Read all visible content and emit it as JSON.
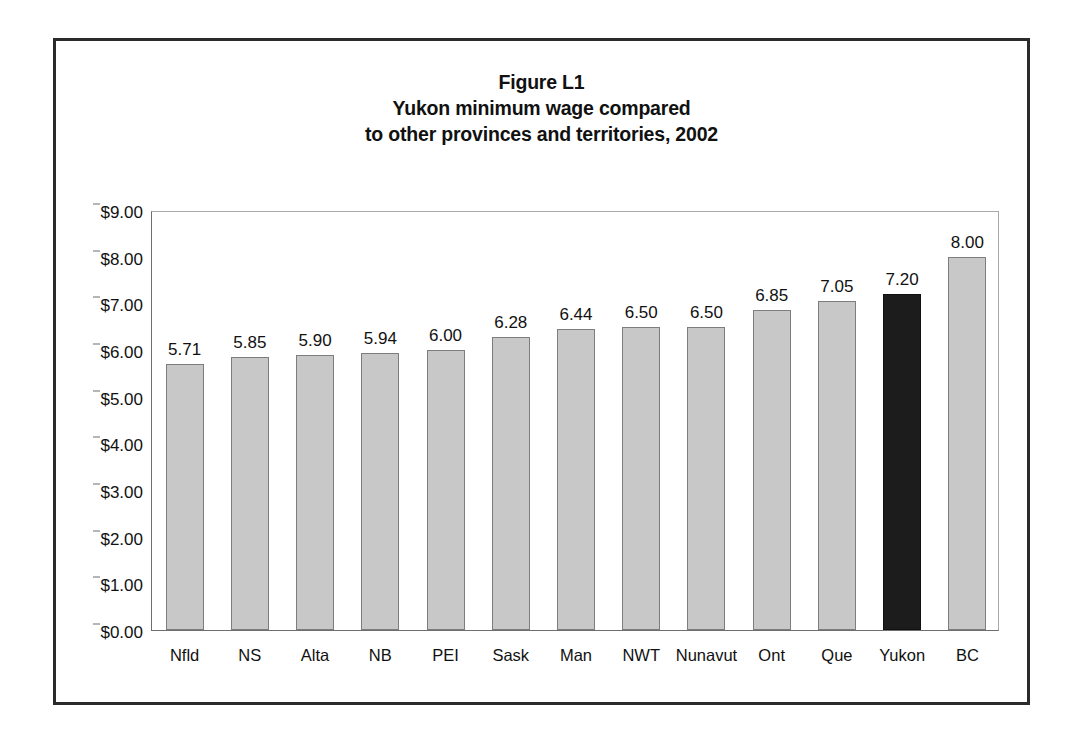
{
  "figure": {
    "title_lines": [
      "Figure L1",
      "Yukon minimum wage compared",
      "to other provinces and territories, 2002"
    ]
  },
  "colors": {
    "bar_fill": "#c8c8c8",
    "bar_border": "#7d7d7d",
    "highlight_fill": "#1c1c1c",
    "frame": "#2b2b2b",
    "axis": "#6e6e6e"
  },
  "chart_data": {
    "type": "bar",
    "title": "Figure L1 Yukon minimum wage compared to other provinces and territories, 2002",
    "xlabel": "",
    "ylabel": "",
    "ylim": [
      0,
      9
    ],
    "ytick_values": [
      0,
      1,
      2,
      3,
      4,
      5,
      6,
      7,
      8,
      9
    ],
    "ytick_labels": [
      "$0.00",
      "$1.00",
      "$2.00",
      "$3.00",
      "$4.00",
      "$5.00",
      "$6.00",
      "$7.00",
      "$8.00",
      "$9.00"
    ],
    "grid": false,
    "legend": "none",
    "highlight_category": "Yukon",
    "categories": [
      "Nfld",
      "NS",
      "Alta",
      "NB",
      "PEI",
      "Sask",
      "Man",
      "NWT",
      "Nunavut",
      "Ont",
      "Que",
      "Yukon",
      "BC"
    ],
    "values": [
      5.71,
      5.85,
      5.9,
      5.94,
      6.0,
      6.28,
      6.44,
      6.5,
      6.5,
      6.85,
      7.05,
      7.2,
      8.0
    ],
    "value_labels": [
      "5.71",
      "5.85",
      "5.90",
      "5.94",
      "6.00",
      "6.28",
      "6.44",
      "6.50",
      "6.50",
      "6.85",
      "7.05",
      "7.20",
      "8.00"
    ]
  }
}
